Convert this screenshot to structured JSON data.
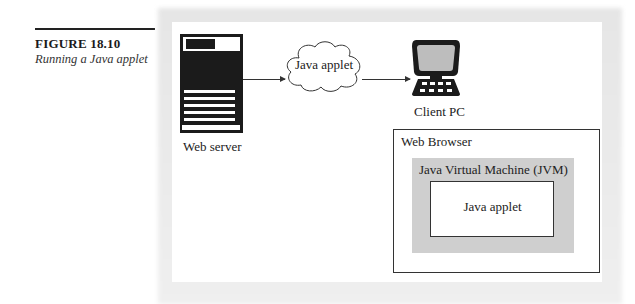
{
  "figure": {
    "number": "FIGURE 18.10",
    "caption": "Running a Java applet"
  },
  "diagram": {
    "nodes": {
      "web_server": {
        "label": "Web server",
        "icon": "server-document-icon"
      },
      "cloud": {
        "label": "Java applet",
        "icon": "cloud-icon"
      },
      "client": {
        "label": "Client PC",
        "icon": "computer-terminal-icon"
      }
    },
    "edges": [
      {
        "from": "web_server",
        "to": "cloud"
      },
      {
        "from": "cloud",
        "to": "client"
      }
    ],
    "containers": {
      "browser": {
        "label": "Web Browser"
      },
      "jvm": {
        "label": "Java Virtual Machine (JVM)"
      },
      "applet": {
        "label": "Java applet"
      }
    },
    "colors": {
      "ink": "#1b1b1b",
      "jvm_fill": "#cfcfcf",
      "screen_fill": "#bdbdbd",
      "background": "#ffffff"
    }
  }
}
